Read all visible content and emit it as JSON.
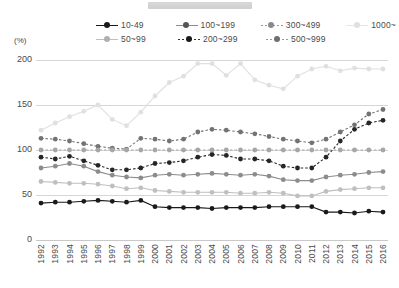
{
  "window": {
    "titlebar_present": true
  },
  "axis": {
    "unit_label": "(%)",
    "y_ticks": [
      0,
      50,
      100,
      150,
      200
    ],
    "ylim": [
      0,
      200
    ],
    "x_ticks": [
      1992,
      1993,
      1994,
      1995,
      1996,
      1997,
      1998,
      1999,
      2000,
      2001,
      2002,
      2003,
      2004,
      2005,
      2006,
      2007,
      2008,
      2009,
      2010,
      2011,
      2012,
      2013,
      2014,
      2015,
      2016
    ]
  },
  "legend": {
    "position": "top",
    "rows": [
      [
        "10-49",
        "100~199",
        "300~499",
        "1000~"
      ],
      [
        "50~99",
        "200~299",
        "500~999"
      ]
    ]
  },
  "chart_data": {
    "type": "line",
    "title": "",
    "xlabel": "",
    "ylabel": "(%)",
    "ylim": [
      0,
      200
    ],
    "grid": true,
    "legend_position": "top",
    "x": [
      1992,
      1993,
      1994,
      1995,
      1996,
      1997,
      1998,
      1999,
      2000,
      2001,
      2002,
      2003,
      2004,
      2005,
      2006,
      2007,
      2008,
      2009,
      2010,
      2011,
      2012,
      2013,
      2014,
      2015,
      2016
    ],
    "series": [
      {
        "name": "10-49",
        "color": "#1a1a1a",
        "style": "solid",
        "values": [
          41,
          42,
          42,
          43,
          44,
          43,
          42,
          44,
          37,
          36,
          36,
          36,
          35,
          36,
          36,
          36,
          37,
          37,
          37,
          37,
          31,
          31,
          30,
          32,
          31
        ]
      },
      {
        "name": "50~99",
        "color": "#bfbfbf",
        "style": "solid",
        "values": [
          65,
          64,
          63,
          63,
          62,
          60,
          57,
          58,
          55,
          54,
          53,
          53,
          53,
          53,
          52,
          52,
          53,
          52,
          49,
          49,
          54,
          56,
          57,
          58,
          58
        ]
      },
      {
        "name": "100~199",
        "color": "#8c8c8c",
        "style": "solid",
        "values": [
          80,
          82,
          85,
          82,
          76,
          72,
          70,
          69,
          72,
          73,
          72,
          73,
          74,
          73,
          72,
          73,
          71,
          67,
          66,
          66,
          70,
          72,
          73,
          75,
          76
        ]
      },
      {
        "name": "200~299",
        "color": "#262626",
        "style": "dotted",
        "values": [
          92,
          90,
          93,
          88,
          83,
          78,
          78,
          80,
          85,
          86,
          88,
          92,
          95,
          94,
          90,
          90,
          88,
          82,
          80,
          80,
          92,
          110,
          123,
          130,
          133
        ]
      },
      {
        "name": "300~499",
        "color": "#737373",
        "style": "dotted",
        "values": [
          113,
          112,
          110,
          107,
          104,
          102,
          101,
          113,
          112,
          110,
          112,
          120,
          123,
          122,
          120,
          118,
          115,
          112,
          110,
          108,
          112,
          120,
          128,
          140,
          145
        ]
      },
      {
        "name": "500~999",
        "color": "#a6a6a6",
        "style": "dotted",
        "values": [
          100,
          100,
          100,
          100,
          100,
          100,
          100,
          100,
          100,
          100,
          100,
          100,
          100,
          100,
          100,
          100,
          100,
          100,
          100,
          100,
          100,
          100,
          100,
          100,
          100
        ]
      },
      {
        "name": "1000~",
        "color": "#e0e0e0",
        "style": "solid",
        "values": [
          122,
          130,
          137,
          143,
          150,
          134,
          127,
          142,
          160,
          175,
          182,
          196,
          196,
          183,
          196,
          178,
          172,
          168,
          182,
          190,
          193,
          188,
          191,
          190,
          190
        ]
      }
    ],
    "series_note_200_299_peaks": [
      158,
      148,
      158
    ]
  }
}
